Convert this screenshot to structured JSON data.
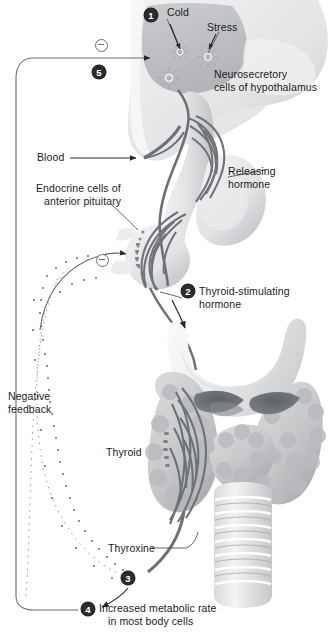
{
  "diagram": {
    "type": "biological-flow-diagram",
    "colors": {
      "marker_fill": "#2b2b2b",
      "marker_text": "#ffffff",
      "vessel_gray": "#6f7276",
      "tissue_light": "#e9e9ea",
      "tissue_mid": "#cfd0d2",
      "tissue_dark": "#9a9c9f",
      "line": "#6b6b6b",
      "text": "#1b1b1b"
    }
  },
  "steps": [
    {
      "id": "1",
      "label": "1"
    },
    {
      "id": "2",
      "label": "2"
    },
    {
      "id": "3",
      "label": "3"
    },
    {
      "id": "4",
      "label": "4"
    },
    {
      "id": "5",
      "label": "5"
    }
  ],
  "labels": {
    "cold": "Cold",
    "stress": "Stress",
    "neurosecretory_line1": "Neurosecretory",
    "neurosecretory_line2": "cells of hypothalamus",
    "blood": "Blood",
    "releasing_line1": "Releasing",
    "releasing_line2": "hormone",
    "endocrine_line1": "Endocrine cells of",
    "endocrine_line2": "anterior pituitary",
    "tsh_line1": "Thyroid-stimulating",
    "tsh_line2": "hormone",
    "negative_line1": "Negative",
    "negative_line2": "feedback",
    "thyroid": "Thyroid",
    "thyroxine": "Thyroxine",
    "metabolic_line1": "Increased metabolic rate",
    "metabolic_line2": "in most body cells"
  },
  "inhibition_signs": [
    {
      "name": "minus-hypothalamus",
      "symbol": "⊖"
    },
    {
      "name": "minus-pituitary",
      "symbol": "⊖"
    }
  ]
}
